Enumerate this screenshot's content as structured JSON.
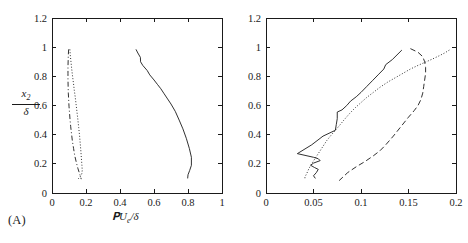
{
  "figure": {
    "background": "#ffffff",
    "line_color": "#1a1a1a",
    "axis_color": "#1a1a1a"
  },
  "panels": [
    {
      "tag": "(A)",
      "xlabel_html": "TU<sub>e</sub>/δ",
      "xlabel_text": "TUe/δ",
      "ylabel_num": "x₂",
      "ylabel_den": "δ",
      "ylabel_text": "x2/δ"
    },
    {
      "tag": "(B)",
      "xlabel_html": "L<sub>i3</sub>/δ",
      "xlabel_text": "Li3/δ",
      "ylabel_num": "",
      "ylabel_den": "",
      "ylabel_text": ""
    }
  ],
  "chart_data": [
    {
      "type": "line",
      "panel": "(A)",
      "title": "",
      "xlabel": "𝒯U_e/δ",
      "ylabel": "x_2/δ",
      "xlim": [
        0,
        1
      ],
      "ylim": [
        0,
        1.2
      ],
      "xticks": [
        0,
        0.2,
        0.4,
        0.6,
        0.8,
        1
      ],
      "xticklabels": [
        "0",
        "0.2",
        "0.4",
        "0.6",
        "0.8",
        "1"
      ],
      "yticks": [
        0,
        0.2,
        0.4,
        0.6,
        0.8,
        1,
        1.2
      ],
      "yticklabels": [
        "0",
        "0.2",
        "0.4",
        "0.6",
        "0.8",
        "1",
        "1.2"
      ],
      "grid": false,
      "legend": "none",
      "series": [
        {
          "name": "solid",
          "style": "solid",
          "x": [
            0.494,
            0.505,
            0.52,
            0.521,
            0.534,
            0.56,
            0.575,
            0.6,
            0.62,
            0.64,
            0.66,
            0.68,
            0.7,
            0.725,
            0.748,
            0.77,
            0.79,
            0.808,
            0.82,
            0.82,
            0.81,
            0.8,
            0.798
          ],
          "y": [
            0.985,
            0.96,
            0.93,
            0.9,
            0.875,
            0.84,
            0.81,
            0.775,
            0.745,
            0.715,
            0.68,
            0.645,
            0.61,
            0.56,
            0.5,
            0.44,
            0.375,
            0.305,
            0.245,
            0.19,
            0.155,
            0.125,
            0.1
          ]
        },
        {
          "name": "dotted",
          "style": "dotted",
          "x": [
            0.105,
            0.108,
            0.112,
            0.116,
            0.121,
            0.126,
            0.131,
            0.137,
            0.142,
            0.147,
            0.152,
            0.157,
            0.162,
            0.166,
            0.17,
            0.173,
            0.176,
            0.178,
            0.175,
            0.165,
            0.15
          ],
          "y": [
            0.985,
            0.94,
            0.895,
            0.85,
            0.8,
            0.755,
            0.705,
            0.655,
            0.605,
            0.555,
            0.505,
            0.45,
            0.395,
            0.34,
            0.285,
            0.235,
            0.19,
            0.155,
            0.13,
            0.11,
            0.092
          ]
        },
        {
          "name": "dash-dot",
          "style": "dashdot",
          "x": [
            0.098,
            0.096,
            0.095,
            0.094,
            0.094,
            0.094,
            0.095,
            0.096,
            0.098,
            0.1,
            0.103,
            0.106,
            0.11,
            0.115,
            0.12,
            0.127,
            0.134,
            0.143,
            0.152,
            0.163,
            0.172
          ],
          "y": [
            0.985,
            0.945,
            0.905,
            0.865,
            0.82,
            0.775,
            0.73,
            0.685,
            0.64,
            0.595,
            0.55,
            0.505,
            0.455,
            0.405,
            0.355,
            0.305,
            0.255,
            0.21,
            0.17,
            0.13,
            0.095
          ]
        }
      ]
    },
    {
      "type": "line",
      "panel": "(B)",
      "title": "",
      "xlabel": "L_i3/δ",
      "ylabel": "x_2/δ",
      "xlim": [
        0,
        0.2
      ],
      "ylim": [
        0,
        1.2
      ],
      "xticks": [
        0,
        0.05,
        0.1,
        0.15,
        0.2
      ],
      "xticklabels": [
        "0",
        "0.05",
        "0.1",
        "0.15",
        "0.2"
      ],
      "yticks": [
        0,
        0.2,
        0.4,
        0.6,
        0.8,
        1,
        1.2
      ],
      "yticklabels": [
        "0",
        "0.2",
        "0.4",
        "0.6",
        "0.8",
        "1",
        "1.2"
      ],
      "grid": false,
      "legend": "none",
      "series": [
        {
          "name": "solid",
          "style": "solid",
          "x": [
            0.143,
            0.133,
            0.126,
            0.124,
            0.118,
            0.112,
            0.106,
            0.1,
            0.095,
            0.089,
            0.085,
            0.08,
            0.075,
            0.075,
            0.074,
            0.073,
            0.06,
            0.048,
            0.033,
            0.05,
            0.055,
            0.057,
            0.05,
            0.047,
            0.051,
            0.055,
            0.053,
            0.05,
            0.052
          ],
          "y": [
            0.98,
            0.915,
            0.88,
            0.85,
            0.81,
            0.77,
            0.73,
            0.69,
            0.66,
            0.63,
            0.6,
            0.57,
            0.555,
            0.51,
            0.47,
            0.43,
            0.39,
            0.33,
            0.27,
            0.245,
            0.235,
            0.222,
            0.205,
            0.19,
            0.175,
            0.162,
            0.14,
            0.118,
            0.1
          ]
        },
        {
          "name": "dotted",
          "style": "dotted",
          "x": [
            0.193,
            0.188,
            0.182,
            0.175,
            0.168,
            0.16,
            0.152,
            0.144,
            0.136,
            0.128,
            0.12,
            0.113,
            0.106,
            0.1,
            0.094,
            0.088,
            0.082,
            0.077,
            0.073,
            0.069,
            0.064,
            0.06,
            0.056,
            0.052,
            0.048,
            0.045,
            0.043,
            0.041,
            0.041
          ],
          "y": [
            0.98,
            0.96,
            0.94,
            0.918,
            0.898,
            0.875,
            0.85,
            0.82,
            0.79,
            0.76,
            0.725,
            0.69,
            0.655,
            0.62,
            0.585,
            0.545,
            0.5,
            0.46,
            0.43,
            0.4,
            0.36,
            0.32,
            0.28,
            0.24,
            0.2,
            0.165,
            0.135,
            0.11,
            0.09
          ]
        },
        {
          "name": "dashed",
          "style": "dashed",
          "x": [
            0.152,
            0.16,
            0.165,
            0.167,
            0.168,
            0.168,
            0.167,
            0.166,
            0.165,
            0.163,
            0.16,
            0.156,
            0.15,
            0.142,
            0.134,
            0.126,
            0.12,
            0.113,
            0.104,
            0.095,
            0.086,
            0.077
          ],
          "y": [
            0.99,
            0.965,
            0.935,
            0.9,
            0.86,
            0.82,
            0.775,
            0.73,
            0.685,
            0.64,
            0.6,
            0.565,
            0.52,
            0.455,
            0.39,
            0.33,
            0.29,
            0.255,
            0.215,
            0.18,
            0.14,
            0.085
          ]
        }
      ]
    }
  ]
}
